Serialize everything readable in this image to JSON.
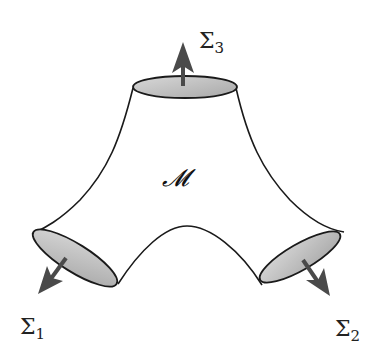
{
  "diagram": {
    "type": "pair-of-pants manifold",
    "manifold_label": "𝓜",
    "boundaries": [
      {
        "id": "sigma1",
        "label": "Σ",
        "subscript": "1",
        "position": "bottom-left"
      },
      {
        "id": "sigma2",
        "label": "Σ",
        "subscript": "2",
        "position": "bottom-right"
      },
      {
        "id": "sigma3",
        "label": "Σ",
        "subscript": "3",
        "position": "top"
      }
    ],
    "colors": {
      "outline": "#1a1a1a",
      "disk_fill": "#b8b8b8",
      "arrow": "#4a4a4a",
      "background": "#ffffff"
    }
  }
}
